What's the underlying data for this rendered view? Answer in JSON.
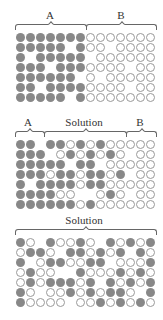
{
  "panels": [
    {
      "labels": [
        {
          "text": "A",
          "x": 50
        },
        {
          "text": "B",
          "x": 121
        }
      ],
      "braces": [
        {
          "from": 15,
          "to": 85
        },
        {
          "from": 86,
          "to": 155
        }
      ],
      "rows": [
        "FFFFFFFOOOOOOO",
        "FFFFF.FOO.OOOO",
        "F.FFFFF.OOOOOO",
        "FFF.FFFOOOO.OO",
        "FFFFFF.O.OOOOO",
        "FF.FFFFOOOO.OO",
        "FFFFF.FOOOOOOO"
      ]
    },
    {
      "labels": [
        {
          "text": "A",
          "x": 28
        },
        {
          "text": "Solution",
          "x": 84
        },
        {
          "text": "B",
          "x": 140
        }
      ],
      "braces": [
        {
          "from": 15,
          "to": 43
        },
        {
          "from": 44,
          "to": 125
        },
        {
          "from": 126,
          "to": 155
        }
      ],
      "rows": [
        "FF.FFOFOFOOOOO",
        "FFF.OFOFOFO.OO",
        "FFFFF.FF.OOOOO",
        "FFFOFFOFFOF.OO",
        "F.FFFFOFFOOOOO",
        "FFFFOO..OFO.OO",
        "FFFFFFOFOOOOOO"
      ]
    },
    {
      "labels": [
        {
          "text": "Solution",
          "x": 84
        }
      ],
      "braces": [
        {
          "from": 15,
          "to": 155
        }
      ],
      "rows": [
        "FO.FOOFO.FOFOF",
        "OFFO.FFOFOF.FO",
        "F.OFFOOFF.OOOF",
        "OFOO..FOOOFOFO",
        "OFOFFFOF.FOFOF",
        "FO.OOFOFOFFO.F",
        "FOOOO.OOFOFOFO"
      ]
    }
  ],
  "legend": {
    "filled": "particle",
    "open": "empty-site"
  },
  "colors": {
    "filled": "#888888",
    "open_stroke": "#999999"
  }
}
